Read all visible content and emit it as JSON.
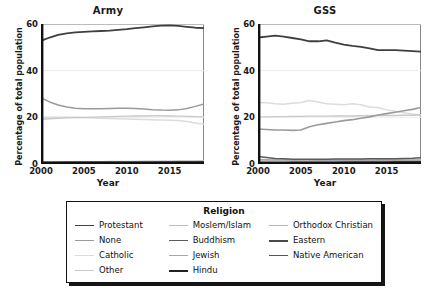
{
  "figure": {
    "ylabel": "Percentage of total population",
    "xlabel": "Year",
    "yticks": [
      "0",
      "20",
      "40",
      "60"
    ],
    "ytick_values": [
      0,
      20,
      40,
      60
    ],
    "xticks": [
      "2000",
      "2005",
      "2010",
      "2015"
    ],
    "xtick_values": [
      2000,
      2005,
      2010,
      2015
    ],
    "xlim": [
      2000,
      2019
    ],
    "ylim": [
      0,
      60
    ]
  },
  "legend": {
    "title": "Religion",
    "columns": [
      [
        {
          "label": "Protestant",
          "color": "#3f3f3f",
          "width": 1.8
        },
        {
          "label": "None",
          "color": "#9a9a9a",
          "width": 1.4
        },
        {
          "label": "Catholic",
          "color": "#dcdcdc",
          "width": 1.4
        },
        {
          "label": "Other",
          "color": "#c9c9c9",
          "width": 1.4
        }
      ],
      [
        {
          "label": "Moslem/Islam",
          "color": "#bdbdbd",
          "width": 1.4
        },
        {
          "label": "Buddhism",
          "color": "#5a5a5a",
          "width": 1.8
        },
        {
          "label": "Jewish",
          "color": "#a8a8a8",
          "width": 1.4
        },
        {
          "label": "Hindu",
          "color": "#222222",
          "width": 2.2
        }
      ],
      [
        {
          "label": "Orthodox Christian",
          "color": "#b5b5b5",
          "width": 1.4
        },
        {
          "label": "Eastern",
          "color": "#4a4a4a",
          "width": 2.0
        },
        {
          "label": "Native American",
          "color": "#555555",
          "width": 1.8
        }
      ]
    ]
  },
  "chart_data": [
    {
      "type": "line",
      "title": "Army",
      "xlabel": "Year",
      "ylabel": "Percentage of total population",
      "xlim": [
        2000,
        2019
      ],
      "ylim": [
        0,
        60
      ],
      "grid": true,
      "legend_position": "below-figure",
      "x": [
        2000,
        2001,
        2002,
        2003,
        2004,
        2005,
        2006,
        2007,
        2008,
        2009,
        2010,
        2011,
        2012,
        2013,
        2014,
        2015,
        2016,
        2017,
        2018,
        2019
      ],
      "series": [
        {
          "name": "Protestant",
          "color": "#3f3f3f",
          "width": 1.8,
          "values": [
            52.8,
            54.2,
            55.3,
            56.0,
            56.4,
            56.6,
            56.8,
            57.0,
            57.2,
            57.5,
            57.8,
            58.2,
            58.6,
            59.0,
            59.3,
            59.4,
            59.2,
            58.8,
            58.4,
            58.2
          ]
        },
        {
          "name": "None",
          "color": "#9a9a9a",
          "width": 1.5,
          "values": [
            28.3,
            26.6,
            25.3,
            24.4,
            23.9,
            23.7,
            23.7,
            23.7,
            23.8,
            23.9,
            23.9,
            23.8,
            23.6,
            23.3,
            23.1,
            23.0,
            23.2,
            23.8,
            24.7,
            25.7
          ]
        },
        {
          "name": "Catholic",
          "color": "#dcdcdc",
          "width": 1.5,
          "values": [
            20.0,
            20.0,
            20.0,
            20.0,
            19.9,
            19.8,
            19.7,
            19.6,
            19.5,
            19.4,
            19.3,
            19.2,
            19.1,
            19.0,
            18.9,
            18.8,
            18.6,
            18.2,
            17.6,
            17.0
          ]
        },
        {
          "name": "Other",
          "color": "#c9c9c9",
          "width": 1.4,
          "values": [
            19.2,
            19.4,
            19.6,
            19.8,
            19.9,
            20.0,
            20.1,
            20.2,
            20.3,
            20.4,
            20.5,
            20.6,
            20.6,
            20.7,
            20.7,
            20.6,
            20.5,
            20.4,
            20.3,
            20.2
          ]
        },
        {
          "name": "Moslem/Islam",
          "color": "#bdbdbd",
          "width": 1.3,
          "values": [
            0.8,
            0.8,
            0.9,
            0.9,
            0.9,
            1.0,
            1.0,
            1.0,
            1.1,
            1.1,
            1.1,
            1.1,
            1.2,
            1.2,
            1.2,
            1.2,
            1.3,
            1.3,
            1.3,
            1.4
          ]
        },
        {
          "name": "Buddhism",
          "color": "#5a5a5a",
          "width": 1.5,
          "values": [
            0.6,
            0.6,
            0.6,
            0.7,
            0.7,
            0.7,
            0.7,
            0.7,
            0.7,
            0.8,
            0.8,
            0.8,
            0.8,
            0.8,
            0.8,
            0.8,
            0.9,
            0.9,
            0.9,
            0.9
          ]
        },
        {
          "name": "Jewish",
          "color": "#a8a8a8",
          "width": 1.3,
          "values": [
            0.5,
            0.5,
            0.5,
            0.5,
            0.5,
            0.5,
            0.4,
            0.4,
            0.4,
            0.4,
            0.4,
            0.4,
            0.4,
            0.4,
            0.4,
            0.4,
            0.4,
            0.4,
            0.4,
            0.4
          ]
        },
        {
          "name": "Hindu",
          "color": "#222222",
          "width": 2.2,
          "values": [
            0.3,
            0.3,
            0.3,
            0.3,
            0.3,
            0.3,
            0.3,
            0.4,
            0.4,
            0.4,
            0.4,
            0.4,
            0.4,
            0.4,
            0.5,
            0.5,
            0.5,
            0.5,
            0.5,
            0.5
          ]
        },
        {
          "name": "Orthodox Christian",
          "color": "#b5b5b5",
          "width": 1.3,
          "values": [
            0.4,
            0.4,
            0.4,
            0.4,
            0.4,
            0.4,
            0.4,
            0.4,
            0.4,
            0.4,
            0.4,
            0.4,
            0.4,
            0.4,
            0.4,
            0.4,
            0.4,
            0.4,
            0.4,
            0.4
          ]
        },
        {
          "name": "Eastern",
          "color": "#4a4a4a",
          "width": 1.8,
          "values": [
            0.2,
            0.2,
            0.2,
            0.2,
            0.2,
            0.2,
            0.2,
            0.2,
            0.2,
            0.2,
            0.2,
            0.2,
            0.2,
            0.2,
            0.2,
            0.2,
            0.2,
            0.2,
            0.2,
            0.2
          ]
        },
        {
          "name": "Native American",
          "color": "#555555",
          "width": 1.6,
          "values": [
            0.3,
            0.3,
            0.3,
            0.3,
            0.3,
            0.3,
            0.3,
            0.3,
            0.3,
            0.3,
            0.3,
            0.3,
            0.3,
            0.3,
            0.3,
            0.3,
            0.3,
            0.3,
            0.3,
            0.3
          ]
        }
      ]
    },
    {
      "type": "line",
      "title": "GSS",
      "xlabel": "Year",
      "ylabel": "Percentage of total population",
      "xlim": [
        2000,
        2019
      ],
      "ylim": [
        0,
        60
      ],
      "grid": true,
      "legend_position": "below-figure",
      "x": [
        2000,
        2001,
        2002,
        2003,
        2004,
        2005,
        2006,
        2007,
        2008,
        2009,
        2010,
        2011,
        2012,
        2013,
        2014,
        2015,
        2016,
        2017,
        2018,
        2019
      ],
      "series": [
        {
          "name": "Protestant",
          "color": "#3f3f3f",
          "width": 1.8,
          "values": [
            54.2,
            54.6,
            55.0,
            54.6,
            54.0,
            53.4,
            52.6,
            52.6,
            53.0,
            52.0,
            51.2,
            50.6,
            50.2,
            49.6,
            48.8,
            48.8,
            48.8,
            48.6,
            48.4,
            48.2
          ]
        },
        {
          "name": "Catholic",
          "color": "#dcdcdc",
          "width": 1.5,
          "values": [
            26.4,
            26.2,
            25.8,
            25.6,
            26.0,
            26.4,
            27.2,
            26.6,
            25.8,
            25.6,
            25.4,
            25.8,
            25.4,
            24.4,
            24.2,
            23.2,
            22.6,
            22.0,
            21.4,
            21.0
          ]
        },
        {
          "name": "None",
          "color": "#9a9a9a",
          "width": 1.6,
          "values": [
            15.0,
            14.8,
            14.6,
            14.6,
            14.4,
            14.6,
            16.0,
            16.8,
            17.4,
            18.0,
            18.6,
            19.0,
            19.6,
            20.2,
            21.0,
            21.6,
            22.2,
            22.8,
            23.4,
            24.2
          ]
        },
        {
          "name": "Other",
          "color": "#c9c9c9",
          "width": 1.4,
          "values": [
            20.2,
            20.2,
            20.3,
            20.3,
            20.4,
            20.4,
            20.5,
            20.5,
            20.5,
            20.6,
            20.6,
            20.6,
            20.7,
            20.7,
            20.8,
            20.8,
            20.8,
            20.9,
            20.9,
            21.0
          ]
        },
        {
          "name": "Moslem/Islam",
          "color": "#bdbdbd",
          "width": 1.3,
          "values": [
            1.6,
            1.6,
            1.6,
            1.6,
            1.6,
            1.7,
            1.7,
            1.7,
            1.7,
            1.8,
            1.8,
            1.8,
            1.8,
            1.8,
            1.9,
            1.9,
            1.9,
            1.9,
            1.9,
            2.0
          ]
        },
        {
          "name": "Buddhism",
          "color": "#5a5a5a",
          "width": 1.5,
          "values": [
            3.2,
            2.8,
            2.4,
            2.2,
            2.0,
            2.0,
            2.0,
            2.0,
            2.0,
            2.1,
            2.1,
            2.1,
            2.1,
            2.2,
            2.2,
            2.2,
            2.3,
            2.4,
            2.5,
            2.7
          ]
        },
        {
          "name": "Jewish",
          "color": "#a8a8a8",
          "width": 1.3,
          "values": [
            2.0,
            1.9,
            1.8,
            1.8,
            1.7,
            1.7,
            1.7,
            1.6,
            1.6,
            1.6,
            1.6,
            1.6,
            1.6,
            1.5,
            1.5,
            1.5,
            1.5,
            1.5,
            1.5,
            1.5
          ]
        },
        {
          "name": "Hindu",
          "color": "#222222",
          "width": 2.2,
          "values": [
            0.4,
            0.4,
            0.4,
            0.4,
            0.5,
            0.5,
            0.5,
            0.5,
            0.5,
            0.5,
            0.6,
            0.6,
            0.6,
            0.6,
            0.6,
            0.6,
            0.7,
            0.7,
            0.7,
            0.7
          ]
        },
        {
          "name": "Orthodox Christian",
          "color": "#b5b5b5",
          "width": 1.3,
          "values": [
            0.6,
            0.6,
            0.6,
            0.6,
            0.6,
            0.6,
            0.6,
            0.6,
            0.6,
            0.6,
            0.6,
            0.6,
            0.6,
            0.6,
            0.6,
            0.6,
            0.6,
            0.6,
            0.6,
            0.6
          ]
        },
        {
          "name": "Eastern",
          "color": "#4a4a4a",
          "width": 1.8,
          "values": [
            0.3,
            0.3,
            0.3,
            0.3,
            0.3,
            0.3,
            0.3,
            0.3,
            0.3,
            0.3,
            0.3,
            0.3,
            0.3,
            0.3,
            0.3,
            0.3,
            0.3,
            0.3,
            0.3,
            0.3
          ]
        },
        {
          "name": "Native American",
          "color": "#555555",
          "width": 1.6,
          "values": [
            0.4,
            0.4,
            0.4,
            0.4,
            0.4,
            0.4,
            0.4,
            0.4,
            0.4,
            0.4,
            0.4,
            0.4,
            0.4,
            0.4,
            0.4,
            0.4,
            0.4,
            0.4,
            0.4,
            0.4
          ]
        }
      ]
    }
  ]
}
